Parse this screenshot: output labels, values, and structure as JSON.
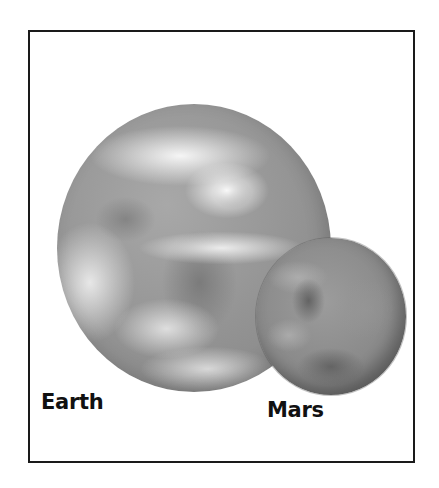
{
  "figure": {
    "type": "planet-size-comparison",
    "planets": [
      {
        "name": "Earth",
        "label": "Earth",
        "shade": "#939393"
      },
      {
        "name": "Mars",
        "label": "Mars",
        "shade": "#8a8a8a"
      }
    ],
    "frame_color": "#1a1a1a",
    "background": "#ffffff"
  }
}
